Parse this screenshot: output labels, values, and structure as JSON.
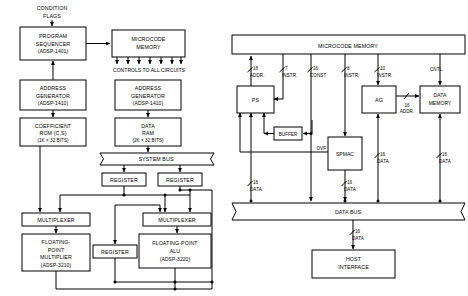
{
  "figure": {
    "type": "block-diagram",
    "panels": [
      {
        "id": "left",
        "name": "floating-point-dsp-system",
        "blocks": [
          {
            "id": "program-sequencer",
            "lines": [
              "PROGRAM",
              "SEQUENCER",
              "(ADSP-1401)"
            ]
          },
          {
            "id": "microcode-memory",
            "lines": [
              "MICROCODE",
              "MEMORY"
            ]
          },
          {
            "id": "address-generator-left",
            "lines": [
              "ADDRESS",
              "GENERATOR",
              "(ADSP-1410)"
            ]
          },
          {
            "id": "coefficient-rom",
            "lines": [
              "COEFFICIENT",
              "ROM (C,S)",
              "(1K × 32 BITS)"
            ]
          },
          {
            "id": "address-generator-right",
            "lines": [
              "ADDRESS",
              "GENERATOR",
              "(ADSP-1410)"
            ]
          },
          {
            "id": "data-ram",
            "lines": [
              "DATA",
              "RAM",
              "(2K × 32 BITS)"
            ]
          },
          {
            "id": "system-bus",
            "lines": [
              "SYSTEM BUS"
            ]
          },
          {
            "id": "register-a",
            "lines": [
              "REGISTER"
            ]
          },
          {
            "id": "register-b",
            "lines": [
              "REGISTER"
            ]
          },
          {
            "id": "multiplexer-left",
            "lines": [
              "MULTIPLEXER"
            ]
          },
          {
            "id": "multiplexer-right",
            "lines": [
              "MULTIPLEXER"
            ]
          },
          {
            "id": "fp-multiplier",
            "lines": [
              "FLOATING-",
              "POINT",
              "MULTIPLIER",
              "(ADSP-3210)"
            ]
          },
          {
            "id": "register-c",
            "lines": [
              "REGISTER"
            ]
          },
          {
            "id": "fp-alu",
            "lines": [
              "FLOATING-POINT",
              "ALU",
              "(ADSP-3220)"
            ]
          }
        ],
        "labels": [
          {
            "id": "condition-flags",
            "lines": [
              "CONDITION",
              "FLAGS"
            ]
          },
          {
            "id": "controls-to-all-circuits",
            "lines": [
              "CONTROLS TO ALL CIRCUITS"
            ]
          }
        ]
      },
      {
        "id": "right",
        "name": "fixed-point-dsp-system",
        "blocks": [
          {
            "id": "microcode-memory",
            "lines": [
              "MICROCODE MEMORY"
            ]
          },
          {
            "id": "ps",
            "lines": [
              "PS"
            ]
          },
          {
            "id": "ag",
            "lines": [
              "AG"
            ]
          },
          {
            "id": "data-memory",
            "lines": [
              "DATA",
              "MEMORY"
            ]
          },
          {
            "id": "buffer",
            "lines": [
              "BUFFER"
            ]
          },
          {
            "id": "spmac",
            "lines": [
              "SPMAC"
            ]
          },
          {
            "id": "data-bus",
            "lines": [
              "DATA BUS"
            ]
          },
          {
            "id": "host-interface",
            "lines": [
              "HOST",
              "INTERFACE"
            ]
          }
        ],
        "bus_labels": [
          {
            "id": "addr-16-ps",
            "width": "16",
            "name": "ADDR."
          },
          {
            "id": "instr-7-ps",
            "width": "7",
            "name": "INSTR."
          },
          {
            "id": "const-16",
            "width": "16",
            "name": "CONST"
          },
          {
            "id": "instr-8-spmac",
            "width": "8",
            "name": "INSTR."
          },
          {
            "id": "instr-10-ag",
            "width": "10",
            "name": "INSTR."
          },
          {
            "id": "cntl",
            "width": "",
            "name": "CNTL."
          },
          {
            "id": "addr-16-ag",
            "width": "16",
            "name": "ADDR."
          },
          {
            "id": "ovf",
            "width": "",
            "name": "OVF"
          },
          {
            "id": "data-16-ps",
            "width": "16",
            "name": "DATA"
          },
          {
            "id": "data-16-spmac",
            "width": "16",
            "name": "DATA"
          },
          {
            "id": "data-16-mid",
            "width": "16",
            "name": "DATA"
          },
          {
            "id": "data-16-dm",
            "width": "16",
            "name": "DATA"
          },
          {
            "id": "data-16-host",
            "width": "16",
            "name": "DATA"
          }
        ]
      }
    ]
  }
}
